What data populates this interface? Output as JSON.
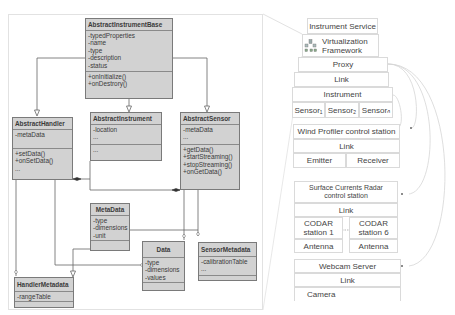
{
  "uml": {
    "classes": [
      {
        "id": "AbstractInstrumentBase",
        "name": "AbstractInstrumentBase",
        "attributes": [
          "-typedProperties",
          "-name",
          "-type",
          "-description",
          "-status"
        ],
        "operations": [
          "+onInitialize()",
          "+onDestrory()"
        ]
      },
      {
        "id": "AbstractHandler",
        "name": "AbstractHandler",
        "attributes": [
          "-metaData",
          ""
        ],
        "operations": [
          "+setData()",
          "+onSetData()",
          "..."
        ]
      },
      {
        "id": "AbstractInstrument",
        "name": "AbstractInstrument",
        "attributes": [
          "-location",
          "..."
        ],
        "operations": [
          "..."
        ]
      },
      {
        "id": "AbstractSensor",
        "name": "AbstractSensor",
        "attributes": [
          "-metaData",
          "..."
        ],
        "operations": [
          "+getData()",
          "+startStreaming()",
          "+stopStreaming()",
          "+onGetData()"
        ]
      },
      {
        "id": "MetaData",
        "name": "MetaData",
        "attributes": [
          "-type",
          "-dimensions",
          "-unit"
        ],
        "operations": [
          ""
        ]
      },
      {
        "id": "Data",
        "name": "Data",
        "attributes": [
          "-type",
          "-dimensions",
          "-values"
        ],
        "operations": [
          ""
        ]
      },
      {
        "id": "SensorMetadata",
        "name": "SensorMetadata",
        "attributes": [
          "-calibrationTable",
          "..."
        ],
        "operations": [
          ""
        ]
      },
      {
        "id": "HandlerMetadata",
        "name": "HandlerMetadata",
        "attributes": [
          "-rangeTable"
        ],
        "operations": [
          ""
        ]
      }
    ]
  },
  "stack": {
    "instrument_service": "Instrument Service",
    "virtualization_framework": "Virtualization Framework",
    "proxy": "Proxy",
    "link": "Link",
    "instrument": "Instrument",
    "sensors": [
      "Sensor₁",
      "Sensor₂",
      "Sensorₙ"
    ]
  },
  "wind_profiler": {
    "title": "Wind Profiler control station",
    "link": "Link",
    "emitter": "Emitter",
    "receiver": "Receiver"
  },
  "surface_radar": {
    "title_line1": "Surface Currents Radar",
    "title_line2": "control station",
    "link": "Link",
    "station1_line1": "CODAR",
    "station1_line2": "station 1",
    "station6_line1": "CODAR",
    "station6_line2": "station 6",
    "antenna1": "Antenna",
    "antenna6": "Antenna"
  },
  "webcam": {
    "title": "Webcam Server",
    "link": "Link",
    "camera": "Camera"
  },
  "colors": {
    "class_fill": "#d2d2d2",
    "class_border": "#7a7a7a",
    "line": "#555555",
    "stack_border": "#dadada"
  }
}
